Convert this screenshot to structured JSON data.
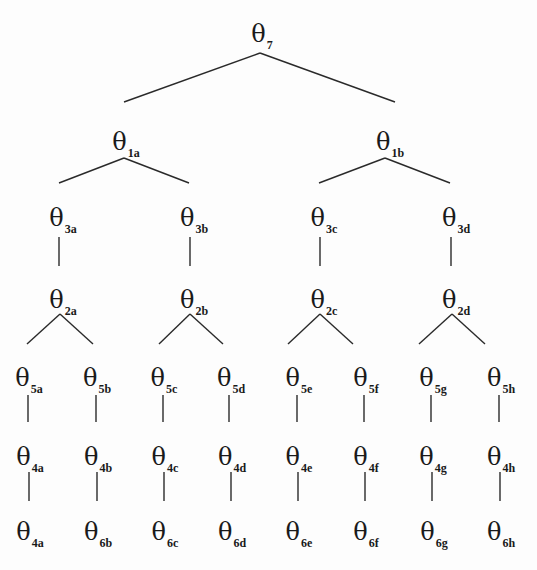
{
  "diagram": {
    "type": "tree",
    "symbol": "θ",
    "nodes": [
      {
        "id": "n7",
        "symbol": "θ",
        "sub": "7",
        "x": 262,
        "y": 34
      },
      {
        "id": "n1a",
        "symbol": "θ",
        "sub": "1a",
        "x": 126,
        "y": 142
      },
      {
        "id": "n1b",
        "symbol": "θ",
        "sub": "1b",
        "x": 390,
        "y": 142
      },
      {
        "id": "n3a",
        "symbol": "θ",
        "sub": "3a",
        "x": 63,
        "y": 218
      },
      {
        "id": "n3b",
        "symbol": "θ",
        "sub": "3b",
        "x": 194,
        "y": 218
      },
      {
        "id": "n3c",
        "symbol": "θ",
        "sub": "3c",
        "x": 324,
        "y": 218
      },
      {
        "id": "n3d",
        "symbol": "θ",
        "sub": "3d",
        "x": 456,
        "y": 218
      },
      {
        "id": "n2a",
        "symbol": "θ",
        "sub": "2a",
        "x": 63,
        "y": 300
      },
      {
        "id": "n2b",
        "symbol": "θ",
        "sub": "2b",
        "x": 194,
        "y": 300
      },
      {
        "id": "n2c",
        "symbol": "θ",
        "sub": "2c",
        "x": 324,
        "y": 300
      },
      {
        "id": "n2d",
        "symbol": "θ",
        "sub": "2d",
        "x": 456,
        "y": 300
      },
      {
        "id": "n5a",
        "symbol": "θ",
        "sub": "5a",
        "x": 29,
        "y": 378
      },
      {
        "id": "n5b",
        "symbol": "θ",
        "sub": "5b",
        "x": 97,
        "y": 378
      },
      {
        "id": "n5c",
        "symbol": "θ",
        "sub": "5c",
        "x": 164,
        "y": 378
      },
      {
        "id": "n5d",
        "symbol": "θ",
        "sub": "5d",
        "x": 231,
        "y": 378
      },
      {
        "id": "n5e",
        "symbol": "θ",
        "sub": "5e",
        "x": 299,
        "y": 378
      },
      {
        "id": "n5f",
        "symbol": "θ",
        "sub": "5f",
        "x": 366,
        "y": 378
      },
      {
        "id": "n5g",
        "symbol": "θ",
        "sub": "5g",
        "x": 433,
        "y": 378
      },
      {
        "id": "n5h",
        "symbol": "θ",
        "sub": "5h",
        "x": 501,
        "y": 378
      },
      {
        "id": "n4a",
        "symbol": "θ",
        "sub": "4a",
        "x": 30,
        "y": 457
      },
      {
        "id": "n4b",
        "symbol": "θ",
        "sub": "4b",
        "x": 98,
        "y": 457
      },
      {
        "id": "n4c",
        "symbol": "θ",
        "sub": "4c",
        "x": 165,
        "y": 457
      },
      {
        "id": "n4d",
        "symbol": "θ",
        "sub": "4d",
        "x": 232,
        "y": 457
      },
      {
        "id": "n4e",
        "symbol": "θ",
        "sub": "4e",
        "x": 299,
        "y": 457
      },
      {
        "id": "n4f",
        "symbol": "θ",
        "sub": "4f",
        "x": 366,
        "y": 457
      },
      {
        "id": "n4g",
        "symbol": "θ",
        "sub": "4g",
        "x": 433,
        "y": 457
      },
      {
        "id": "n4h",
        "symbol": "θ",
        "sub": "4h",
        "x": 501,
        "y": 457
      },
      {
        "id": "n6a",
        "symbol": "θ",
        "sub": "4a",
        "x": 30,
        "y": 532
      },
      {
        "id": "n6b",
        "symbol": "θ",
        "sub": "6b",
        "x": 98,
        "y": 532
      },
      {
        "id": "n6c",
        "symbol": "θ",
        "sub": "6c",
        "x": 165,
        "y": 532
      },
      {
        "id": "n6d",
        "symbol": "θ",
        "sub": "6d",
        "x": 232,
        "y": 532
      },
      {
        "id": "n6e",
        "symbol": "θ",
        "sub": "6e",
        "x": 299,
        "y": 532
      },
      {
        "id": "n6f",
        "symbol": "θ",
        "sub": "6f",
        "x": 366,
        "y": 532
      },
      {
        "id": "n6g",
        "symbol": "θ",
        "sub": "6g",
        "x": 434,
        "y": 532
      },
      {
        "id": "n6h",
        "symbol": "θ",
        "sub": "6h",
        "x": 501,
        "y": 532
      }
    ],
    "edges": [
      {
        "from": "n7",
        "to": "n1a",
        "x1": 260,
        "y1": 53,
        "x2": 124,
        "y2": 102
      },
      {
        "from": "n7",
        "to": "n1b",
        "x1": 260,
        "y1": 53,
        "x2": 395,
        "y2": 102
      },
      {
        "from": "n1a",
        "to": "n3a",
        "x1": 124,
        "y1": 158,
        "x2": 59,
        "y2": 183
      },
      {
        "from": "n1a",
        "to": "n3b",
        "x1": 124,
        "y1": 158,
        "x2": 189,
        "y2": 183
      },
      {
        "from": "n1b",
        "to": "n3c",
        "x1": 385,
        "y1": 158,
        "x2": 319,
        "y2": 183
      },
      {
        "from": "n1b",
        "to": "n3d",
        "x1": 385,
        "y1": 158,
        "x2": 450,
        "y2": 183
      },
      {
        "from": "n3a",
        "to": "n2a",
        "x1": 59,
        "y1": 237,
        "x2": 59,
        "y2": 266
      },
      {
        "from": "n3b",
        "to": "n2b",
        "x1": 190,
        "y1": 237,
        "x2": 190,
        "y2": 266
      },
      {
        "from": "n3c",
        "to": "n2c",
        "x1": 320,
        "y1": 237,
        "x2": 320,
        "y2": 266
      },
      {
        "from": "n3d",
        "to": "n2d",
        "x1": 451,
        "y1": 237,
        "x2": 451,
        "y2": 266
      },
      {
        "from": "n2a",
        "to": "n5a",
        "x1": 60,
        "y1": 314,
        "x2": 27,
        "y2": 344
      },
      {
        "from": "n2a",
        "to": "n5b",
        "x1": 60,
        "y1": 314,
        "x2": 93,
        "y2": 344
      },
      {
        "from": "n2b",
        "to": "n5c",
        "x1": 190,
        "y1": 314,
        "x2": 159,
        "y2": 344
      },
      {
        "from": "n2b",
        "to": "n5d",
        "x1": 190,
        "y1": 314,
        "x2": 223,
        "y2": 344
      },
      {
        "from": "n2c",
        "to": "n5e",
        "x1": 320,
        "y1": 314,
        "x2": 288,
        "y2": 344
      },
      {
        "from": "n2c",
        "to": "n5f",
        "x1": 320,
        "y1": 314,
        "x2": 353,
        "y2": 344
      },
      {
        "from": "n2d",
        "to": "n5g",
        "x1": 452,
        "y1": 314,
        "x2": 419,
        "y2": 344
      },
      {
        "from": "n2d",
        "to": "n5h",
        "x1": 452,
        "y1": 314,
        "x2": 485,
        "y2": 344
      },
      {
        "from": "n5a",
        "to": "n4a",
        "x1": 28,
        "y1": 395,
        "x2": 28,
        "y2": 422
      },
      {
        "from": "n5b",
        "to": "n4b",
        "x1": 96,
        "y1": 395,
        "x2": 96,
        "y2": 422
      },
      {
        "from": "n5c",
        "to": "n4c",
        "x1": 163,
        "y1": 395,
        "x2": 163,
        "y2": 422
      },
      {
        "from": "n5d",
        "to": "n4d",
        "x1": 229,
        "y1": 395,
        "x2": 229,
        "y2": 422
      },
      {
        "from": "n5e",
        "to": "n4e",
        "x1": 297,
        "y1": 395,
        "x2": 297,
        "y2": 422
      },
      {
        "from": "n5f",
        "to": "n4f",
        "x1": 364,
        "y1": 395,
        "x2": 364,
        "y2": 422
      },
      {
        "from": "n5g",
        "to": "n4g",
        "x1": 431,
        "y1": 395,
        "x2": 431,
        "y2": 422
      },
      {
        "from": "n5h",
        "to": "n4h",
        "x1": 499,
        "y1": 395,
        "x2": 499,
        "y2": 422
      },
      {
        "from": "n4a",
        "to": "n6a",
        "x1": 29,
        "y1": 472,
        "x2": 29,
        "y2": 501
      },
      {
        "from": "n4b",
        "to": "n6b",
        "x1": 97,
        "y1": 472,
        "x2": 97,
        "y2": 501
      },
      {
        "from": "n4c",
        "to": "n6c",
        "x1": 164,
        "y1": 472,
        "x2": 164,
        "y2": 501
      },
      {
        "from": "n4d",
        "to": "n6d",
        "x1": 231,
        "y1": 472,
        "x2": 231,
        "y2": 501
      },
      {
        "from": "n4e",
        "to": "n6e",
        "x1": 298,
        "y1": 472,
        "x2": 298,
        "y2": 501
      },
      {
        "from": "n4f",
        "to": "n6f",
        "x1": 365,
        "y1": 472,
        "x2": 365,
        "y2": 501
      },
      {
        "from": "n4g",
        "to": "n6g",
        "x1": 432,
        "y1": 472,
        "x2": 432,
        "y2": 501
      },
      {
        "from": "n4h",
        "to": "n6h",
        "x1": 500,
        "y1": 472,
        "x2": 500,
        "y2": 501
      }
    ]
  }
}
